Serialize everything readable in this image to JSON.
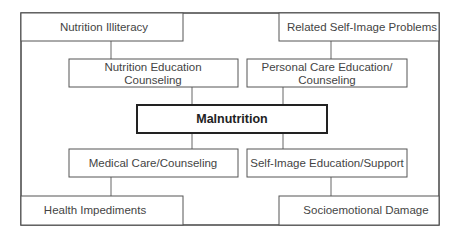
{
  "diagram": {
    "type": "flow-diagram",
    "center": {
      "label": "Malnutrition"
    },
    "nodes": {
      "nutrition_illiteracy": "Nutrition Illiteracy",
      "related_self_image_problems": "Related Self-Image Problems",
      "nutrition_education": [
        "Nutrition Education",
        "Counseling"
      ],
      "personal_care_education": [
        "Personal Care Education/",
        "Counseling"
      ],
      "medical_care": "Medical Care/Counseling",
      "self_image_education": "Self-Image Education/Support",
      "health_impediments": "Health Impediments",
      "socioemotional_damage": "Socioemotional Damage"
    },
    "edges": [
      [
        "nutrition_illiteracy",
        "nutrition_education"
      ],
      [
        "nutrition_education",
        "center"
      ],
      [
        "related_self_image_problems",
        "personal_care_education"
      ],
      [
        "personal_care_education",
        "center"
      ],
      [
        "center",
        "medical_care"
      ],
      [
        "medical_care",
        "health_impediments"
      ],
      [
        "center",
        "self_image_education"
      ],
      [
        "self_image_education",
        "socioemotional_damage"
      ]
    ]
  }
}
